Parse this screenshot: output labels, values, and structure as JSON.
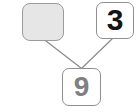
{
  "diagram": {
    "type": "node-link-tree",
    "background_color": "#ffffff",
    "nodes": [
      {
        "id": "blank",
        "label": "",
        "role": "empty-slot",
        "shape": "rounded-rectangle",
        "fill_color": "#e6e6e6",
        "border_color": "#9b9b9b",
        "text_color": "",
        "x": 22,
        "y": 3,
        "width": 42,
        "height": 38
      },
      {
        "id": "three",
        "label": "3",
        "role": "value",
        "shape": "rounded-rectangle",
        "fill_color": "#ffffff",
        "border_color": "#8f8f8f",
        "text_color": "#141414",
        "x": 96,
        "y": 2,
        "width": 38,
        "height": 37
      },
      {
        "id": "nine",
        "label": "9",
        "role": "value",
        "shape": "rounded-rectangle",
        "fill_color": "#ffffff",
        "border_color": "#8f8f8f",
        "text_color": "#808080",
        "x": 62,
        "y": 68,
        "width": 39,
        "height": 38
      }
    ],
    "edges": [
      {
        "id": "edge-blank-nine",
        "from": "blank",
        "to": "nine",
        "color": "#8a8a8a",
        "width": 1.2,
        "x1": 46,
        "y1": 41,
        "x2": 81,
        "y2": 68
      },
      {
        "id": "edge-three-nine",
        "from": "three",
        "to": "nine",
        "color": "#8a8a8a",
        "width": 1.2,
        "x1": 112,
        "y1": 39,
        "x2": 82,
        "y2": 68
      }
    ]
  }
}
